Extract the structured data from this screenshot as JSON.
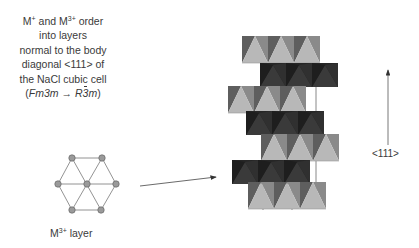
{
  "caption": {
    "line1_prefix": "M",
    "line1_sup1": "+",
    "line1_mid": " and M",
    "line1_sup2": "3+",
    "line1_suffix": " order",
    "line2": "into layers",
    "line3": "normal to the body",
    "line4": "diagonal <111> of",
    "line5": "the NaCl cubic cell",
    "line6_open": "(",
    "line6_from": "Fm3m",
    "line6_arrow": "→",
    "line6_to_R": "R",
    "line6_to_3": "3",
    "line6_to_m": "m",
    "line6_close": ")"
  },
  "hex_layer": {
    "label_prefix": "M",
    "label_sup": "3+",
    "label_suffix": " layer",
    "node_color": "#9a9a9a",
    "line_color": "#777777"
  },
  "structure": {
    "layer_count": 7,
    "light_layer_colors": {
      "face": "#b8b8b8",
      "side_left": "#5e5e5e",
      "side_right": "#8a8a8a"
    },
    "dark_layer_colors": {
      "base": "#262626",
      "face": "#4a4a4a"
    },
    "stacking_arrow_label": "<111>"
  }
}
